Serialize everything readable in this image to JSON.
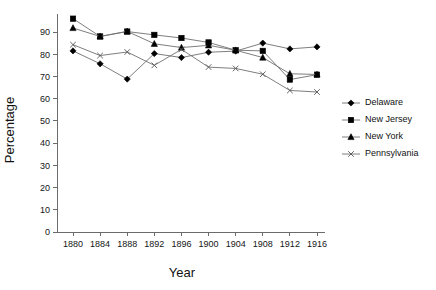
{
  "chart_data": {
    "type": "line",
    "title": "",
    "xlabel": "Year",
    "ylabel": "Percentage",
    "categories": [
      1880,
      1884,
      1888,
      1892,
      1896,
      1900,
      1904,
      1908,
      1912,
      1916
    ],
    "x": [
      1880,
      1884,
      1888,
      1892,
      1896,
      1900,
      1904,
      1908,
      1912,
      1916
    ],
    "xlim": [
      1878,
      1918
    ],
    "ylim": [
      0,
      95
    ],
    "grid": false,
    "legend_position": "right",
    "y_ticks": [
      0,
      10,
      20,
      30,
      40,
      50,
      60,
      70,
      80,
      90
    ],
    "x_ticks": [
      1880,
      1884,
      1888,
      1892,
      1896,
      1900,
      1904,
      1908,
      1912,
      1916
    ],
    "series": [
      {
        "name": "Delaware",
        "marker": "diamond",
        "values": [
          81.5,
          75.7,
          68.8,
          80.3,
          78.5,
          80.9,
          81.4,
          85.0,
          82.4,
          83.3
        ]
      },
      {
        "name": "New Jersey",
        "marker": "square",
        "values": [
          96.0,
          88.0,
          90.2,
          88.7,
          87.3,
          85.3,
          81.8,
          81.5,
          68.6,
          70.8
        ]
      },
      {
        "name": "New York",
        "marker": "triangle",
        "values": [
          91.8,
          88.0,
          90.3,
          84.7,
          83.0,
          84.0,
          81.8,
          78.5,
          71.2,
          70.9
        ]
      },
      {
        "name": "Pennsylvania",
        "marker": "cross",
        "values": [
          84.3,
          79.4,
          81.0,
          75.0,
          82.2,
          74.2,
          73.6,
          71.0,
          63.7,
          63.0
        ]
      }
    ]
  },
  "legend": {
    "items": [
      {
        "label": "Delaware"
      },
      {
        "label": "New Jersey"
      },
      {
        "label": "New York"
      },
      {
        "label": "Pennsylvania"
      }
    ]
  },
  "axes": {
    "y_title": "Percentage",
    "x_title": "Year"
  }
}
